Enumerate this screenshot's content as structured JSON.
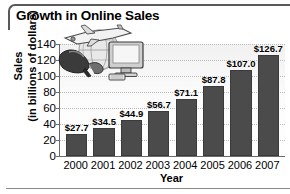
{
  "chart_data": {
    "type": "bar",
    "title": "Growth in Online Sales",
    "xlabel": "Year",
    "ylabel": "Sales",
    "ylabel_sub": "(in billions of dollars)",
    "categories": [
      "2000",
      "2001",
      "2002",
      "2003",
      "2004",
      "2005",
      "2006",
      "2007"
    ],
    "values": [
      27.7,
      34.5,
      44.9,
      56.7,
      71.1,
      87.8,
      107.0,
      126.7
    ],
    "data_labels": [
      "$27.7",
      "$34.5",
      "$44.9",
      "$56.7",
      "$71.1",
      "$87.8",
      "$107.0",
      "$126.7"
    ],
    "yticks": [
      0,
      20,
      40,
      60,
      80,
      100,
      120,
      140
    ],
    "ytick_labels": [
      "0",
      "20",
      "40",
      "60",
      "80",
      "100",
      "120",
      "140"
    ],
    "ylim": [
      0,
      140
    ],
    "grid": true,
    "legend": false,
    "bar_color": "#4b4b4b",
    "axis_color": "#6b6b6b",
    "gridline_color": "#b9b9b9"
  },
  "decoration": {
    "clipart_names": [
      "airplane-icon",
      "globe-icon",
      "high-heel-shoe-icon",
      "computer-monitor-icon"
    ]
  }
}
